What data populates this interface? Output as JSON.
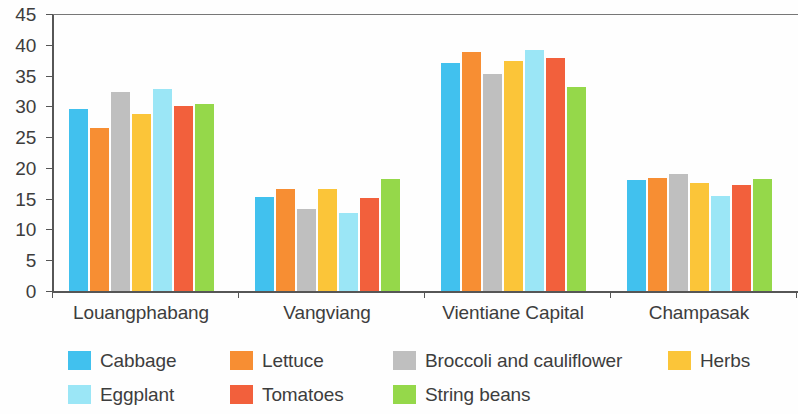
{
  "chart_data": {
    "type": "bar",
    "title": "",
    "xlabel": "",
    "ylabel": "",
    "ylim": [
      0,
      45
    ],
    "ytick_step": 5,
    "yticks": [
      0,
      5,
      10,
      15,
      20,
      25,
      30,
      35,
      40,
      45
    ],
    "grid": false,
    "legend_position": "bottom",
    "categories": [
      "Louangphabang",
      "Vangviang",
      "Vientiane Capital",
      "Champasak"
    ],
    "series": [
      {
        "name": "Cabbage",
        "color": "#41C1EE",
        "values": [
          29.6,
          15.3,
          37.1,
          18.0
        ]
      },
      {
        "name": "Lettuce",
        "color": "#F78E33",
        "values": [
          26.5,
          16.5,
          38.9,
          18.3
        ]
      },
      {
        "name": "Broccoli and cauliflower",
        "color": "#BFBFBF",
        "values": [
          32.4,
          13.3,
          35.2,
          19.0
        ]
      },
      {
        "name": "Herbs",
        "color": "#FBC539",
        "values": [
          28.7,
          16.5,
          37.4,
          17.6
        ]
      },
      {
        "name": "Eggplant",
        "color": "#9BE6F6",
        "values": [
          32.8,
          12.6,
          39.2,
          15.4
        ]
      },
      {
        "name": "Tomatoes",
        "color": "#F2603C",
        "values": [
          30.1,
          15.1,
          37.8,
          17.3
        ]
      },
      {
        "name": "String beans",
        "color": "#95D84A",
        "values": [
          30.4,
          18.2,
          33.1,
          18.2
        ]
      }
    ]
  },
  "legend": {
    "items": [
      {
        "label": "Cabbage",
        "color": "#41C1EE"
      },
      {
        "label": "Lettuce",
        "color": "#F78E33"
      },
      {
        "label": "Broccoli and cauliflower",
        "color": "#BFBFBF"
      },
      {
        "label": "Herbs",
        "color": "#FBC539"
      },
      {
        "label": "Eggplant",
        "color": "#9BE6F6"
      },
      {
        "label": "Tomatoes",
        "color": "#F2603C"
      },
      {
        "label": "String beans",
        "color": "#95D84A"
      }
    ]
  },
  "axis": {
    "y_tick_labels": [
      "45",
      "40",
      "35",
      "30",
      "25",
      "20",
      "15",
      "10",
      "5",
      "0"
    ],
    "x_tick_labels": [
      "Louangphabang",
      "Vangviang",
      "Vientiane Capital",
      "Champasak"
    ]
  },
  "colors": {
    "axis": "#565656",
    "text": "#3d3d3d",
    "background": "#fefefe"
  }
}
